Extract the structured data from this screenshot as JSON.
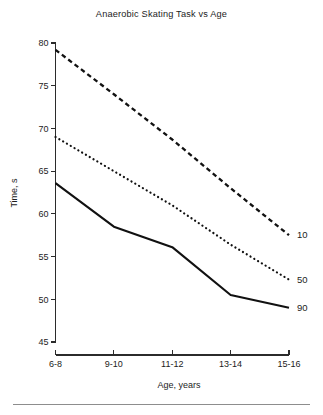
{
  "figure": {
    "title": "Anaerobic Skating Task vs Age",
    "background_color": "#ffffff",
    "ink_color": "#111111",
    "footer_rule": true
  },
  "axes": {
    "x_label": "Age, years",
    "y_label": "Time, s",
    "y_ticks": [
      "80",
      "75",
      "70",
      "65",
      "60",
      "55",
      "50",
      "45"
    ],
    "x_ticks": [
      "6-8",
      "9-10",
      "11-12",
      "13-14",
      "15-16"
    ]
  },
  "series_labels": {
    "p10": "10",
    "p50": "50",
    "p90": "90"
  },
  "chart_data": {
    "type": "line",
    "title": "Anaerobic Skating Task vs Age",
    "xlabel": "Age, years",
    "ylabel": "Time, s",
    "categories": [
      "6-8",
      "9-10",
      "11-12",
      "13-14",
      "15-16"
    ],
    "ylim": [
      45,
      80
    ],
    "yticks": [
      45,
      50,
      55,
      60,
      65,
      70,
      75,
      80
    ],
    "grid": false,
    "legend_position": "right-of-line-ends",
    "series": [
      {
        "name": "10",
        "style": "dashed",
        "label_position": "right-end",
        "values": [
          79.2,
          74.0,
          68.7,
          63.0,
          57.5
        ]
      },
      {
        "name": "50",
        "style": "dotted",
        "label_position": "right-end",
        "values": [
          69.0,
          65.0,
          61.0,
          56.4,
          52.3
        ]
      },
      {
        "name": "90",
        "style": "solid",
        "label_position": "right-end",
        "values": [
          63.6,
          58.5,
          56.1,
          50.5,
          49.0
        ]
      }
    ]
  }
}
